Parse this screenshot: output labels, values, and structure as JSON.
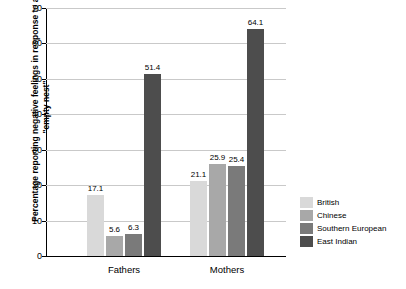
{
  "chart_data": {
    "type": "bar",
    "title": "",
    "subtitle": "",
    "xlabel": "",
    "ylabel": "Percentage reporting negative feelings in response to an \"empty nest\"",
    "categories": [
      "Fathers",
      "Mothers"
    ],
    "series": [
      {
        "name": "British",
        "values": [
          17.1,
          21.1
        ],
        "color": "#d9d9d9"
      },
      {
        "name": "Chinese",
        "values": [
          5.6,
          25.9
        ],
        "color": "#a8a8a8"
      },
      {
        "name": "Southern European",
        "values": [
          6.3,
          25.4
        ],
        "color": "#7a7a7a"
      },
      {
        "name": "East Indian",
        "values": [
          51.4,
          64.1
        ],
        "color": "#4d4d4d"
      }
    ],
    "ylim": [
      0,
      70
    ],
    "yticks": [
      0,
      10,
      20,
      30,
      40,
      50,
      60,
      70
    ],
    "grid": true,
    "legend_position": "right"
  },
  "legend": {
    "items": [
      {
        "label": "British",
        "color": "#d9d9d9"
      },
      {
        "label": "Chinese",
        "color": "#a8a8a8"
      },
      {
        "label": "Southern European",
        "color": "#7a7a7a"
      },
      {
        "label": "East Indian",
        "color": "#4d4d4d"
      }
    ]
  }
}
